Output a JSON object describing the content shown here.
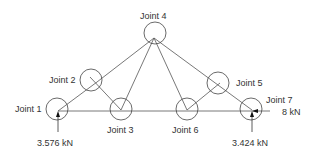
{
  "diagram": {
    "type": "truss",
    "joints": [
      {
        "id": 1,
        "label": "Joint 1"
      },
      {
        "id": 2,
        "label": "Joint 2"
      },
      {
        "id": 3,
        "label": "Joint 3"
      },
      {
        "id": 4,
        "label": "Joint 4"
      },
      {
        "id": 5,
        "label": "Joint 5"
      },
      {
        "id": 6,
        "label": "Joint 6"
      },
      {
        "id": 7,
        "label": "Joint 7"
      }
    ],
    "members": [
      [
        "1",
        "2"
      ],
      [
        "2",
        "4"
      ],
      [
        "4",
        "3"
      ],
      [
        "4",
        "6"
      ],
      [
        "4",
        "5"
      ],
      [
        "5",
        "7"
      ],
      [
        "2",
        "3"
      ],
      [
        "5",
        "6"
      ],
      [
        "1",
        "7"
      ]
    ],
    "forces": [
      {
        "joint": 1,
        "label": "3.576 kN",
        "direction": "up"
      },
      {
        "joint": 7,
        "label": "3.424 kN",
        "direction": "up"
      },
      {
        "joint": 7,
        "label": "8 kN",
        "direction": "left"
      }
    ],
    "colors": {
      "line": "#555555",
      "text": "#333333"
    }
  }
}
